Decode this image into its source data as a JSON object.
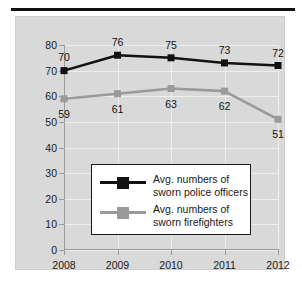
{
  "chart_data": {
    "type": "line",
    "title": "",
    "subtitle": "",
    "xlabel": "",
    "ylabel": "",
    "categories": [
      "2008",
      "2009",
      "2010",
      "2011",
      "2012"
    ],
    "xlim": [
      2008,
      2012
    ],
    "ylim": [
      0,
      80
    ],
    "yticks": [
      "0",
      "10",
      "20",
      "30",
      "40",
      "50",
      "60",
      "70",
      "80"
    ],
    "ytick_values": [
      0,
      10,
      20,
      30,
      40,
      50,
      60,
      70,
      80
    ],
    "grid": true,
    "legend_position": "center",
    "series": [
      {
        "name": "Avg. numbers of sworn police officers",
        "legend_line_1": "Avg. numbers of",
        "legend_line_2": "sworn police officers",
        "color": "#111111",
        "marker": "square",
        "values": [
          70,
          76,
          75,
          73,
          72
        ],
        "label_offsets_y": [
          -14,
          -13,
          -13,
          -13,
          -13
        ]
      },
      {
        "name": "Avg. numbers of sworn firefighters",
        "legend_line_1": "Avg. numbers of",
        "legend_line_2": "sworn firefighters",
        "color": "#9a9a9a",
        "marker": "square",
        "values": [
          59,
          61,
          63,
          62,
          51
        ],
        "label_offsets_y": [
          15,
          15,
          15,
          15,
          15
        ]
      }
    ]
  },
  "figure": {
    "panel_color": "#d9d9d9",
    "background_color": "#ffffff",
    "rule_color": "#111111",
    "axis_color": "#9b9b9b",
    "gridline_color": "#eeeeee"
  }
}
